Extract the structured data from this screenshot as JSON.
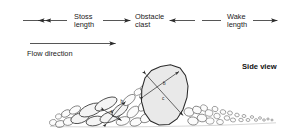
{
  "figure": {
    "title_label": "Side view",
    "view_label_name": "side-view-label"
  },
  "measurements": [
    {
      "id": "stoss",
      "label_line1": "Stoss",
      "label_line2": "length",
      "arrow_style": "double-headed"
    },
    {
      "id": "obstacle",
      "label_line1": "Obstacle",
      "label_line2": "clast",
      "arrow_style": "converging"
    },
    {
      "id": "wake",
      "label_line1": "Wake",
      "label_line2": "length",
      "arrow_style": "double-headed"
    }
  ],
  "flow": {
    "label": "Flow direction",
    "arrow_direction": "right"
  },
  "clast_axes": {
    "obstacle": {
      "b_label": "b",
      "c_label": "c"
    },
    "stoss_clast": {
      "b_label": "b",
      "c_label": "c"
    }
  },
  "colors": {
    "background": "#ffffff",
    "ink": "#2b2b2b",
    "obstacle_fill": "#e9e9e9",
    "clast_fill": "#ffffff",
    "text": "#1a1a1a"
  }
}
